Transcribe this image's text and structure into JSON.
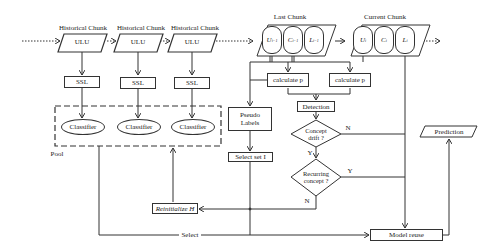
{
  "diagram": {
    "historical_chunks": [
      {
        "title": "Historical Chunk",
        "data": "ULU",
        "process": "SSL",
        "model": "Classifier"
      },
      {
        "title": "Historical Chunk",
        "data": "ULU",
        "process": "SSL",
        "model": "Classifier"
      },
      {
        "title": "Historical Chunk",
        "data": "ULU",
        "process": "SSL",
        "model": "Classifier"
      }
    ],
    "pool_label": "Pool",
    "last_chunk": {
      "title": "Last Chunk",
      "parts": [
        {
          "base": "U",
          "sup": "i−1"
        },
        {
          "base": "C",
          "sup": "i−1"
        },
        {
          "base": "L",
          "sup": "i−1"
        }
      ]
    },
    "current_chunk": {
      "title": "Current Chunk",
      "parts": [
        {
          "base": "U",
          "sup": "i"
        },
        {
          "base": "C",
          "sup": "i"
        },
        {
          "base": "L",
          "sup": "i"
        }
      ]
    },
    "calc_left": "calculate  p",
    "calc_right": "calculate  p",
    "detection": "Detection",
    "concept_drift": "Concept drift ?",
    "recurring_concept": "Recurring concept ?",
    "pseudo_labels": "Pseudo Labels",
    "select_set": "Select set I",
    "reinitialize": "Reinitialize H",
    "model_reuse": "Model reuse",
    "prediction": "Prediction",
    "select_edge": "Select",
    "edge_labels": {
      "drift_no": "N",
      "drift_yes": "Y",
      "recurring_yes": "Y",
      "recurring_no": "N"
    }
  }
}
